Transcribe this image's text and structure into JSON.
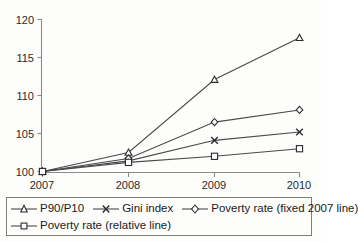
{
  "chart_data": {
    "type": "line",
    "title": "",
    "subtitle": "",
    "xlabel": "",
    "ylabel": "",
    "categories": [
      "2007",
      "2008",
      "2009",
      "2010"
    ],
    "x_tick_labels": [
      "2007",
      "2008",
      "2009",
      "2010"
    ],
    "y_tick_labels": [
      "100",
      "105",
      "110",
      "115",
      "120"
    ],
    "y_ticks": [
      100,
      105,
      110,
      115,
      120
    ],
    "ylim": [
      100,
      120
    ],
    "grid": false,
    "legend_position": "bottom",
    "series": [
      {
        "name": "P90/P10",
        "marker": "triangle",
        "values": [
          100,
          102.5,
          112.1,
          117.6
        ]
      },
      {
        "name": "Gini index",
        "marker": "x",
        "values": [
          100,
          101.4,
          104.1,
          105.2
        ]
      },
      {
        "name": "Poverty rate (fixed 2007 line)",
        "marker": "diamond",
        "values": [
          100,
          101.7,
          106.5,
          108.1
        ]
      },
      {
        "name": "Poverty rate (relative line)",
        "marker": "square",
        "values": [
          100,
          101.2,
          102.0,
          103.0
        ]
      }
    ],
    "colors": {
      "line": "#4a4a4a",
      "marker_stroke": "#2b2b2b",
      "marker_fill": "#ffffff",
      "axis": "#8a8a8a",
      "background": "#fdfdfc"
    }
  },
  "legend": {
    "rows": [
      [
        {
          "label": "P90/P10",
          "marker": "triangle"
        },
        {
          "label": "Gini index",
          "marker": "x"
        },
        {
          "label": "Poverty rate (fixed 2007 line)",
          "marker": "diamond"
        }
      ],
      [
        {
          "label": "Poverty rate (relative line)",
          "marker": "square"
        }
      ]
    ]
  }
}
